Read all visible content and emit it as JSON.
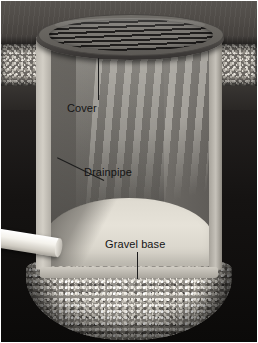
{
  "image": {
    "kind": "cutaway-illustration",
    "subject": "dry well / catch basin cross-section",
    "width": 258,
    "height": 343
  },
  "labels": [
    {
      "id": "cover",
      "text": "Cover",
      "leader": "vertical-up"
    },
    {
      "id": "drainpipe",
      "text": "Drainpipe",
      "leader": "diagonal-down-left"
    },
    {
      "id": "gravel",
      "text": "Gravel base",
      "leader": "vertical-down"
    }
  ],
  "label_text": {
    "cover": "Cover",
    "drainpipe": "Drainpipe",
    "gravel_base": "Gravel base"
  },
  "parts": {
    "cover": "slotted round grate cover",
    "basin": "cylindrical basin, front cut away",
    "floor": "basin floor",
    "pipe": "white drainpipe entering from left",
    "gravel": "gravel base mound beneath basin",
    "backfill": "gravel backfill band",
    "ground": "ground surface",
    "soil": "surrounding soil"
  },
  "colors": {
    "ground_surface": "#4e4a46",
    "soil_deep": "#151312",
    "basin_wall_light": "#d3cfc6",
    "basin_interior": "#6a6762",
    "basin_floor": "#e6e2d8",
    "cover_rim": "#4b4845",
    "cover_slot_dark": "#201e1d",
    "gravel": "#8e8a83",
    "pipe": "#ffffff",
    "label_text": "#141414",
    "leader_line": "#1c1c1c",
    "frame": "#ffffff"
  }
}
